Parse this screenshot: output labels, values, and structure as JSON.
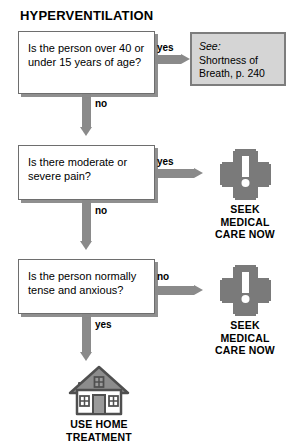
{
  "title": "HYPERVENTILATION",
  "nodes": {
    "q1": {
      "text": "Is the person over 40 or under 15 years of age?",
      "yes_label": "yes",
      "no_label": "no"
    },
    "q2": {
      "text": "Is there moderate or severe pain?",
      "yes_label": "yes",
      "no_label": "no"
    },
    "q3": {
      "text": "Is the person normally tense and anxious?",
      "no_label": "no",
      "yes_label": "yes"
    }
  },
  "reference": {
    "see_label": "See:",
    "target": "Shortness of Breath, p. 240"
  },
  "outcomes": {
    "seek_care_1": {
      "label": "SEEK\nMEDICAL\nCARE NOW",
      "icon": "medical-cross-exclamation-icon"
    },
    "seek_care_2": {
      "label": "SEEK\nMEDICAL\nCARE NOW",
      "icon": "medical-cross-exclamation-icon"
    },
    "home_treatment": {
      "label": "USE HOME\nTREATMENT",
      "icon": "house-icon"
    }
  },
  "colors": {
    "arrow_gray": "#8a8a8a",
    "cross_gray": "#7a7a7a",
    "ref_box_fill": "#d5d5d5",
    "ref_box_border": "#7d7d7d",
    "box_border": "#6e6e6e",
    "box_shadow": "#8f8f8f",
    "house_gray": "#7a7a7a",
    "text_black": "#000000",
    "background": "#ffffff"
  }
}
